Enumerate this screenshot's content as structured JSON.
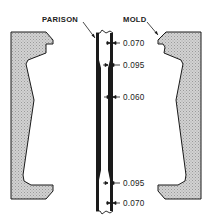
{
  "diagram": {
    "type": "cross-section",
    "labels": {
      "parison": "PARISON",
      "mold": "MOLD"
    },
    "dimensions": [
      {
        "value": "0.070",
        "position": "top"
      },
      {
        "value": "0.095",
        "position": "upper-shoulder"
      },
      {
        "value": "0.060",
        "position": "middle"
      },
      {
        "value": "0.095",
        "position": "lower"
      },
      {
        "value": "0.070",
        "position": "bottom"
      }
    ],
    "colors": {
      "line": "#1a1a1a",
      "mold_fill": "#c8c8c8",
      "background": "#ffffff"
    }
  }
}
